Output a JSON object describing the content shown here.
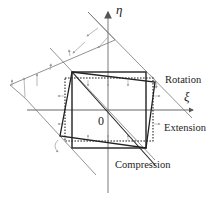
{
  "diagram": {
    "axes": {
      "horizontal_label": "ξ",
      "vertical_label": "η",
      "origin_label": "0"
    },
    "annotations": {
      "rotation": "Rotation",
      "extension": "Extension",
      "compression": "Compression"
    },
    "colors": {
      "axis": "#999999",
      "square": "#222222",
      "guide": "#777777",
      "arrow": "#9a9a9a"
    }
  }
}
